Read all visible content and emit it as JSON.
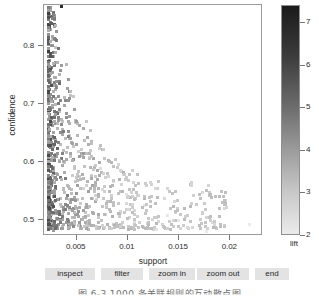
{
  "chart_data": {
    "type": "scatter",
    "title": "",
    "xlabel": "support",
    "ylabel": "confidence",
    "xlim": [
      0.0018,
      0.0232
    ],
    "ylim": [
      0.492,
      0.888
    ],
    "xticks": [
      0.005,
      0.01,
      0.015,
      0.02
    ],
    "xticklabels": [
      "0.005",
      "0.01",
      "0.015",
      "0.02"
    ],
    "yticks": [
      0.5,
      0.6,
      0.7,
      0.8
    ],
    "yticklabels": [
      "0.5",
      "0.6",
      "0.7",
      "0.8"
    ],
    "grid": false,
    "n_points": 1000,
    "colormap": {
      "variable": "lift",
      "title": "lift",
      "low": "#ebebeb",
      "high": "#1a1a1a",
      "ticks": [
        2,
        3,
        4,
        5,
        6,
        7
      ],
      "ticklabels": [
        "2",
        "3",
        "4",
        "5",
        "6",
        "7"
      ],
      "range": [
        2,
        7.4
      ]
    },
    "points": [
      {
        "x": 0.00355,
        "y": 0.885,
        "lift": 6.9
      },
      {
        "x": 0.00245,
        "y": 0.846,
        "lift": 3.6
      },
      {
        "x": 0.00265,
        "y": 0.829,
        "lift": 3.2
      },
      {
        "x": 0.00255,
        "y": 0.818,
        "lift": 4.1
      },
      {
        "x": 0.00295,
        "y": 0.815,
        "lift": 3.0
      },
      {
        "x": 0.00245,
        "y": 0.804,
        "lift": 3.9
      },
      {
        "x": 0.00275,
        "y": 0.799,
        "lift": 3.4
      },
      {
        "x": 0.00235,
        "y": 0.793,
        "lift": 4.5
      },
      {
        "x": 0.00395,
        "y": 0.786,
        "lift": 3.3
      },
      {
        "x": 0.00255,
        "y": 0.781,
        "lift": 4.8
      },
      {
        "x": 0.00245,
        "y": 0.776,
        "lift": 5.2
      },
      {
        "x": 0.00265,
        "y": 0.772,
        "lift": 4.0
      },
      {
        "x": 0.00235,
        "y": 0.767,
        "lift": 4.6
      },
      {
        "x": 0.00285,
        "y": 0.763,
        "lift": 3.6
      },
      {
        "x": 0.00245,
        "y": 0.757,
        "lift": 5.0
      },
      {
        "x": 0.00255,
        "y": 0.752,
        "lift": 3.8
      },
      {
        "x": 0.00305,
        "y": 0.748,
        "lift": 3.3
      },
      {
        "x": 0.00235,
        "y": 0.744,
        "lift": 4.9
      },
      {
        "x": 0.00275,
        "y": 0.739,
        "lift": 3.5
      },
      {
        "x": 0.00245,
        "y": 0.734,
        "lift": 4.3
      },
      {
        "x": 0.00465,
        "y": 0.731,
        "lift": 2.9
      },
      {
        "x": 0.00255,
        "y": 0.727,
        "lift": 4.7
      },
      {
        "x": 0.00235,
        "y": 0.722,
        "lift": 5.3
      },
      {
        "x": 0.00295,
        "y": 0.718,
        "lift": 3.4
      },
      {
        "x": 0.00265,
        "y": 0.713,
        "lift": 4.2
      },
      {
        "x": 0.00245,
        "y": 0.709,
        "lift": 4.8
      },
      {
        "x": 0.00335,
        "y": 0.705,
        "lift": 3.1
      },
      {
        "x": 0.00235,
        "y": 0.701,
        "lift": 5.1
      },
      {
        "x": 0.00285,
        "y": 0.697,
        "lift": 3.7
      },
      {
        "x": 0.00255,
        "y": 0.693,
        "lift": 4.4
      },
      {
        "x": 0.00365,
        "y": 0.689,
        "lift": 3.0
      },
      {
        "x": 0.00245,
        "y": 0.685,
        "lift": 4.9
      },
      {
        "x": 0.00265,
        "y": 0.681,
        "lift": 4.1
      },
      {
        "x": 0.00315,
        "y": 0.677,
        "lift": 3.3
      },
      {
        "x": 0.00235,
        "y": 0.673,
        "lift": 5.4
      },
      {
        "x": 0.00275,
        "y": 0.669,
        "lift": 3.8
      },
      {
        "x": 0.00425,
        "y": 0.665,
        "lift": 2.8
      },
      {
        "x": 0.00245,
        "y": 0.661,
        "lift": 4.6
      },
      {
        "x": 0.00295,
        "y": 0.657,
        "lift": 3.5
      },
      {
        "x": 0.00255,
        "y": 0.653,
        "lift": 4.3
      },
      {
        "x": 0.00345,
        "y": 0.649,
        "lift": 3.2
      },
      {
        "x": 0.00235,
        "y": 0.645,
        "lift": 5.6
      },
      {
        "x": 0.00265,
        "y": 0.641,
        "lift": 4.0
      },
      {
        "x": 0.00515,
        "y": 0.637,
        "lift": 2.7
      },
      {
        "x": 0.00245,
        "y": 0.633,
        "lift": 4.8
      },
      {
        "x": 0.00285,
        "y": 0.629,
        "lift": 3.6
      },
      {
        "x": 0.00625,
        "y": 0.626,
        "lift": 2.5
      },
      {
        "x": 0.00255,
        "y": 0.622,
        "lift": 4.5
      },
      {
        "x": 0.00375,
        "y": 0.618,
        "lift": 3.0
      },
      {
        "x": 0.00235,
        "y": 0.614,
        "lift": 5.8
      },
      {
        "x": 0.00275,
        "y": 0.61,
        "lift": 3.9
      },
      {
        "x": 0.00735,
        "y": 0.607,
        "lift": 2.4
      },
      {
        "x": 0.00245,
        "y": 0.603,
        "lift": 4.7
      },
      {
        "x": 0.00305,
        "y": 0.599,
        "lift": 3.4
      },
      {
        "x": 0.00455,
        "y": 0.596,
        "lift": 2.8
      },
      {
        "x": 0.00235,
        "y": 0.592,
        "lift": 6.0
      },
      {
        "x": 0.00265,
        "y": 0.588,
        "lift": 4.2
      },
      {
        "x": 0.00855,
        "y": 0.585,
        "lift": 2.3
      },
      {
        "x": 0.00245,
        "y": 0.581,
        "lift": 5.0
      },
      {
        "x": 0.00295,
        "y": 0.577,
        "lift": 3.5
      },
      {
        "x": 0.00565,
        "y": 0.574,
        "lift": 2.6
      },
      {
        "x": 0.00235,
        "y": 0.57,
        "lift": 6.2
      },
      {
        "x": 0.00255,
        "y": 0.566,
        "lift": 4.6
      },
      {
        "x": 0.00985,
        "y": 0.563,
        "lift": 2.2
      },
      {
        "x": 0.00275,
        "y": 0.559,
        "lift": 3.9
      },
      {
        "x": 0.00345,
        "y": 0.556,
        "lift": 3.2
      },
      {
        "x": 0.00235,
        "y": 0.552,
        "lift": 6.4
      },
      {
        "x": 0.00245,
        "y": 0.548,
        "lift": 5.2
      },
      {
        "x": 0.01165,
        "y": 0.545,
        "lift": 2.2
      },
      {
        "x": 0.00265,
        "y": 0.541,
        "lift": 4.4
      },
      {
        "x": 0.00425,
        "y": 0.538,
        "lift": 2.9
      },
      {
        "x": 0.00235,
        "y": 0.534,
        "lift": 6.6
      },
      {
        "x": 0.00285,
        "y": 0.53,
        "lift": 3.7
      },
      {
        "x": 0.01385,
        "y": 0.527,
        "lift": 2.1
      },
      {
        "x": 0.00245,
        "y": 0.523,
        "lift": 5.4
      },
      {
        "x": 0.00325,
        "y": 0.52,
        "lift": 3.3
      },
      {
        "x": 0.00235,
        "y": 0.516,
        "lift": 6.9
      },
      {
        "x": 0.00255,
        "y": 0.512,
        "lift": 4.9
      },
      {
        "x": 0.00605,
        "y": 0.509,
        "lift": 2.5
      },
      {
        "x": 0.00235,
        "y": 0.505,
        "lift": 7.1
      },
      {
        "x": 0.00275,
        "y": 0.501,
        "lift": 4.1
      },
      {
        "x": 0.02185,
        "y": 0.512,
        "lift": 2.0
      },
      {
        "x": 0.01765,
        "y": 0.5,
        "lift": 2.0
      },
      {
        "x": 0.01495,
        "y": 0.518,
        "lift": 2.1
      },
      {
        "x": 0.01275,
        "y": 0.504,
        "lift": 2.2
      },
      {
        "x": 0.01065,
        "y": 0.516,
        "lift": 2.3
      },
      {
        "x": 0.00925,
        "y": 0.533,
        "lift": 2.4
      },
      {
        "x": 0.00795,
        "y": 0.546,
        "lift": 2.5
      },
      {
        "x": 0.00685,
        "y": 0.561,
        "lift": 2.6
      },
      {
        "x": 0.00595,
        "y": 0.579,
        "lift": 2.7
      },
      {
        "x": 0.00525,
        "y": 0.594,
        "lift": 2.8
      },
      {
        "x": 0.00475,
        "y": 0.611,
        "lift": 2.9
      },
      {
        "x": 0.00435,
        "y": 0.628,
        "lift": 3.0
      },
      {
        "x": 0.00405,
        "y": 0.644,
        "lift": 3.1
      },
      {
        "x": 0.00385,
        "y": 0.659,
        "lift": 3.2
      },
      {
        "x": 0.00365,
        "y": 0.675,
        "lift": 3.3
      },
      {
        "x": 0.00355,
        "y": 0.691,
        "lift": 3.4
      },
      {
        "x": 0.00545,
        "y": 0.641,
        "lift": 2.8
      },
      {
        "x": 0.00645,
        "y": 0.596,
        "lift": 2.6
      },
      {
        "x": 0.00755,
        "y": 0.571,
        "lift": 2.5
      }
    ]
  },
  "axis": {
    "ylabel": "confidence",
    "xlabel": "support",
    "ytick_labels": [
      "0.8",
      "0.7",
      "0.6",
      "0.5"
    ],
    "xtick_labels": [
      "0.005",
      "0.01",
      "0.015",
      "0.02"
    ]
  },
  "legend": {
    "title": "lift",
    "tick_labels": [
      "7",
      "6",
      "5",
      "4",
      "3",
      "2"
    ]
  },
  "toolbar": {
    "buttons": [
      {
        "label": "inspect",
        "left": 0,
        "width": 50
      },
      {
        "label": "filter",
        "left": 56,
        "width": 42
      },
      {
        "label": "zoom in",
        "left": 104,
        "width": 46
      },
      {
        "label": "zoom out",
        "left": 152,
        "width": 52
      },
      {
        "label": "end",
        "left": 210,
        "width": 34
      }
    ]
  },
  "caption": {
    "text": "图 6-3  1000 条关联规则的互动散点图"
  }
}
